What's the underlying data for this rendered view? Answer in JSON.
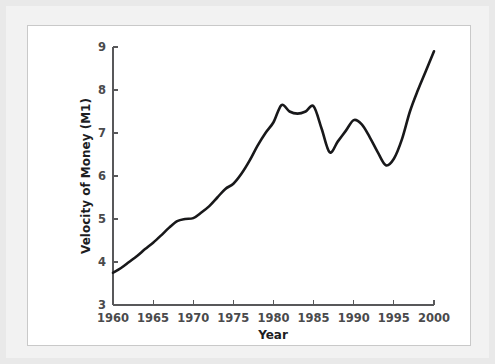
{
  "figure": {
    "background_color": "#e9e9e9",
    "panel_color": "#ffffff",
    "panel_border_color": "#c9c9c9",
    "line_color": "#18181a",
    "axis_color": "#58585a"
  },
  "chart_data": {
    "type": "line",
    "title": "",
    "xlabel": "Year",
    "ylabel": "Velocity of Money (M1)",
    "xlim": [
      1960,
      2000
    ],
    "ylim": [
      3,
      9
    ],
    "xticks": [
      1960,
      1965,
      1970,
      1975,
      1980,
      1985,
      1990,
      1995,
      2000
    ],
    "xtick_labels": [
      "1960",
      "1965",
      "1970",
      "1975",
      "1980",
      "1985",
      "1990",
      "1995",
      "2000"
    ],
    "yticks": [
      3,
      4,
      5,
      6,
      7,
      8,
      9
    ],
    "ytick_labels": [
      "3",
      "4",
      "5",
      "6",
      "7",
      "8",
      "9"
    ],
    "grid": false,
    "legend": false,
    "series": [
      {
        "name": "Velocity of Money (M1)",
        "x": [
          1960,
          1961,
          1962,
          1963,
          1964,
          1965,
          1966,
          1967,
          1968,
          1969,
          1970,
          1971,
          1972,
          1973,
          1974,
          1975,
          1976,
          1977,
          1978,
          1979,
          1980,
          1981,
          1982,
          1983,
          1984,
          1985,
          1986,
          1987,
          1988,
          1989,
          1990,
          1991,
          1992,
          1993,
          1994,
          1995,
          1996,
          1997,
          1998,
          1999,
          2000
        ],
        "values": [
          3.75,
          3.86,
          4.0,
          4.14,
          4.3,
          4.45,
          4.62,
          4.8,
          4.95,
          5.0,
          5.02,
          5.15,
          5.3,
          5.5,
          5.7,
          5.82,
          6.05,
          6.35,
          6.7,
          7.0,
          7.25,
          7.65,
          7.5,
          7.45,
          7.5,
          7.62,
          7.1,
          6.55,
          6.8,
          7.05,
          7.3,
          7.2,
          6.9,
          6.55,
          6.25,
          6.4,
          6.85,
          7.5,
          8.0,
          8.45,
          8.9
        ]
      }
    ]
  }
}
